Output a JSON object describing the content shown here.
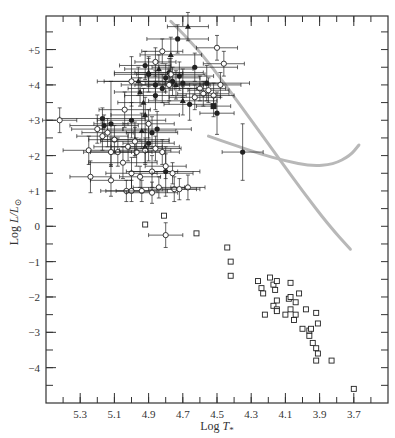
{
  "chart_data": {
    "type": "scatter",
    "title": "",
    "xlabel": "Log T*",
    "xlabel_parts": {
      "main": "Log ",
      "var": "T",
      "sub": "*"
    },
    "ylabel": "Log L/L⊙",
    "ylabel_parts": {
      "main": "Log ",
      "var": "L/L",
      "sub": "⊙"
    },
    "xlim": [
      5.5,
      3.5
    ],
    "ylim": [
      -5.0,
      5.95
    ],
    "x_reversed": true,
    "grid": false,
    "legend": null,
    "xticks": [
      5.3,
      5.1,
      4.9,
      4.7,
      4.5,
      4.3,
      4.1,
      3.9,
      3.7
    ],
    "xtick_labels": [
      "5.3",
      "5.1",
      "4.9",
      "4.7",
      "4.5",
      "4.3",
      "4.1",
      "3.9",
      "3.7"
    ],
    "xminor_step": 0.1,
    "yticks": [
      5,
      4,
      3,
      2,
      1,
      0,
      -1,
      -2,
      -3,
      -4
    ],
    "ytick_labels": [
      "+5",
      "+4",
      "+3",
      "+2",
      "+1",
      "0",
      "−1",
      "−2",
      "−3",
      "−4"
    ],
    "yminor_step": 0.5,
    "colors": {
      "axis": "#333333",
      "points": "#222222",
      "curves": "#b8b8b8"
    },
    "series": [
      {
        "name": "filled-circles",
        "marker": "filled-circle",
        "points": [
          {
            "x": 4.35,
            "y": 2.1,
            "xerr": 0.12,
            "yerr": 0.8
          },
          {
            "x": 4.73,
            "y": 5.3,
            "xerr": 0.18,
            "yerr": 0.4
          },
          {
            "x": 4.56,
            "y": 4.05,
            "xerr": 0.25,
            "yerr": 0.5
          },
          {
            "x": 4.66,
            "y": 3.45,
            "xerr": 0.15,
            "yerr": 0.45
          },
          {
            "x": 4.5,
            "y": 3.2,
            "xerr": 0.1,
            "yerr": 0.6
          },
          {
            "x": 5.12,
            "y": 2.9,
            "xerr": 0.1,
            "yerr": 1.2
          },
          {
            "x": 5.17,
            "y": 3.05,
            "xerr": 0.25,
            "yerr": 0.3
          },
          {
            "x": 5.16,
            "y": 2.85,
            "xerr": 0.2,
            "yerr": 0.3
          },
          {
            "x": 5.0,
            "y": 3.0,
            "xerr": 0.2,
            "yerr": 0.5
          },
          {
            "x": 4.92,
            "y": 4.55,
            "xerr": 0.15,
            "yerr": 0.4
          },
          {
            "x": 4.9,
            "y": 4.3,
            "xerr": 0.2,
            "yerr": 0.5
          },
          {
            "x": 4.86,
            "y": 4.0,
            "xerr": 0.2,
            "yerr": 0.4
          },
          {
            "x": 4.86,
            "y": 3.7,
            "xerr": 0.18,
            "yerr": 0.4
          },
          {
            "x": 4.82,
            "y": 3.9,
            "xerr": 0.2,
            "yerr": 0.4
          },
          {
            "x": 4.8,
            "y": 4.2,
            "xerr": 0.2,
            "yerr": 0.4
          },
          {
            "x": 4.78,
            "y": 4.35,
            "xerr": 0.2,
            "yerr": 0.4
          },
          {
            "x": 4.76,
            "y": 4.1,
            "xerr": 0.2,
            "yerr": 0.4
          },
          {
            "x": 4.72,
            "y": 4.25,
            "xerr": 0.2,
            "yerr": 0.4
          },
          {
            "x": 4.7,
            "y": 4.05,
            "xerr": 0.22,
            "yerr": 0.4
          },
          {
            "x": 4.63,
            "y": 4.5,
            "xerr": 0.25,
            "yerr": 0.4
          },
          {
            "x": 4.9,
            "y": 2.35,
            "xerr": 0.15,
            "yerr": 0.5
          },
          {
            "x": 4.88,
            "y": 2.65,
            "xerr": 0.15,
            "yerr": 0.45
          },
          {
            "x": 4.8,
            "y": 1.55,
            "xerr": 0.2,
            "yerr": 0.7
          },
          {
            "x": 4.85,
            "y": 2.75,
            "xerr": 0.2,
            "yerr": 0.5
          }
        ]
      },
      {
        "name": "filled-triangles",
        "marker": "filled-triangle",
        "points": [
          {
            "x": 4.67,
            "y": 5.65,
            "xerr": 0.12,
            "yerr": 0.4
          },
          {
            "x": 4.77,
            "y": 4.85,
            "xerr": 0.18,
            "yerr": 0.5
          },
          {
            "x": 4.96,
            "y": 4.1,
            "xerr": 0.2,
            "yerr": 0.4
          },
          {
            "x": 4.9,
            "y": 4.35,
            "xerr": 0.2,
            "yerr": 0.4
          },
          {
            "x": 4.84,
            "y": 4.45,
            "xerr": 0.2,
            "yerr": 0.4
          },
          {
            "x": 4.74,
            "y": 4.0,
            "xerr": 0.2,
            "yerr": 0.4
          },
          {
            "x": 4.7,
            "y": 3.55,
            "xerr": 0.2,
            "yerr": 0.4
          },
          {
            "x": 4.95,
            "y": 3.8,
            "xerr": 0.15,
            "yerr": 0.4
          },
          {
            "x": 4.93,
            "y": 3.5,
            "xerr": 0.15,
            "yerr": 0.4
          },
          {
            "x": 4.92,
            "y": 3.15,
            "xerr": 0.2,
            "yerr": 0.5
          },
          {
            "x": 4.94,
            "y": 2.7,
            "xerr": 0.2,
            "yerr": 0.5
          },
          {
            "x": 4.98,
            "y": 2.45,
            "xerr": 0.2,
            "yerr": 0.5
          },
          {
            "x": 4.92,
            "y": 2.25,
            "xerr": 0.2,
            "yerr": 0.5
          }
        ]
      },
      {
        "name": "filled-square",
        "marker": "filled-square",
        "points": [
          {
            "x": 4.52,
            "y": 3.4,
            "xerr": 0.1,
            "yerr": 0.3
          }
        ]
      },
      {
        "name": "open-circles",
        "marker": "open-circle",
        "points": [
          {
            "x": 5.42,
            "y": 3.0,
            "xerr": 0.1,
            "yerr": 0.35
          },
          {
            "x": 5.0,
            "y": 4.1,
            "xerr": 0.2,
            "yerr": 0.7
          },
          {
            "x": 5.04,
            "y": 3.3,
            "xerr": 0.15,
            "yerr": 0.5
          },
          {
            "x": 4.86,
            "y": 4.65,
            "xerr": 0.12,
            "yerr": 0.4
          },
          {
            "x": 4.82,
            "y": 4.95,
            "xerr": 0.12,
            "yerr": 0.35
          },
          {
            "x": 4.77,
            "y": 4.3,
            "xerr": 0.2,
            "yerr": 0.45
          },
          {
            "x": 4.78,
            "y": 4.0,
            "xerr": 0.2,
            "yerr": 0.45
          },
          {
            "x": 4.5,
            "y": 5.05,
            "xerr": 0.12,
            "yerr": 0.35
          },
          {
            "x": 4.46,
            "y": 4.6,
            "xerr": 0.12,
            "yerr": 0.35
          },
          {
            "x": 4.6,
            "y": 3.9,
            "xerr": 0.15,
            "yerr": 0.35
          },
          {
            "x": 4.58,
            "y": 3.75,
            "xerr": 0.15,
            "yerr": 0.35
          },
          {
            "x": 4.55,
            "y": 3.85,
            "xerr": 0.12,
            "yerr": 0.35
          },
          {
            "x": 4.52,
            "y": 3.7,
            "xerr": 0.12,
            "yerr": 0.35
          },
          {
            "x": 4.63,
            "y": 3.65,
            "xerr": 0.15,
            "yerr": 0.35
          },
          {
            "x": 4.48,
            "y": 4.0,
            "xerr": 0.12,
            "yerr": 0.35
          },
          {
            "x": 5.2,
            "y": 2.75,
            "xerr": 0.15,
            "yerr": 0.4
          },
          {
            "x": 5.17,
            "y": 2.55,
            "xerr": 0.15,
            "yerr": 0.4
          },
          {
            "x": 5.14,
            "y": 2.65,
            "xerr": 0.15,
            "yerr": 0.4
          },
          {
            "x": 5.1,
            "y": 2.45,
            "xerr": 0.15,
            "yerr": 0.4
          },
          {
            "x": 5.08,
            "y": 2.1,
            "xerr": 0.2,
            "yerr": 0.4
          },
          {
            "x": 5.02,
            "y": 2.25,
            "xerr": 0.2,
            "yerr": 0.4
          },
          {
            "x": 4.97,
            "y": 2.1,
            "xerr": 0.15,
            "yerr": 0.4
          },
          {
            "x": 4.9,
            "y": 2.9,
            "xerr": 0.15,
            "yerr": 0.4
          },
          {
            "x": 4.98,
            "y": 2.4,
            "xerr": 0.2,
            "yerr": 0.4
          },
          {
            "x": 5.25,
            "y": 2.15,
            "xerr": 0.15,
            "yerr": 0.4
          },
          {
            "x": 5.12,
            "y": 2.1,
            "xerr": 0.12,
            "yerr": 0.4
          },
          {
            "x": 5.05,
            "y": 1.8,
            "xerr": 0.2,
            "yerr": 0.45
          },
          {
            "x": 5.0,
            "y": 1.5,
            "xerr": 0.15,
            "yerr": 0.45
          },
          {
            "x": 4.88,
            "y": 1.55,
            "xerr": 0.15,
            "yerr": 0.45
          },
          {
            "x": 5.24,
            "y": 1.4,
            "xerr": 0.12,
            "yerr": 0.45
          },
          {
            "x": 5.12,
            "y": 1.3,
            "xerr": 0.12,
            "yerr": 0.45
          },
          {
            "x": 5.03,
            "y": 1.0,
            "xerr": 0.15,
            "yerr": 0.3
          },
          {
            "x": 5.0,
            "y": 1.0,
            "xerr": 0.15,
            "yerr": 0.3
          },
          {
            "x": 4.94,
            "y": 1.0,
            "xerr": 0.15,
            "yerr": 0.3
          },
          {
            "x": 4.88,
            "y": 0.95,
            "xerr": 0.15,
            "yerr": 0.3
          },
          {
            "x": 4.84,
            "y": 1.1,
            "xerr": 0.15,
            "yerr": 0.3
          },
          {
            "x": 4.75,
            "y": 1.05,
            "xerr": 0.15,
            "yerr": 0.35
          },
          {
            "x": 4.95,
            "y": 1.4,
            "xerr": 0.12,
            "yerr": 0.3
          },
          {
            "x": 4.92,
            "y": 2.15,
            "xerr": 0.15,
            "yerr": 0.35
          },
          {
            "x": 4.86,
            "y": 2.2,
            "xerr": 0.15,
            "yerr": 0.35
          },
          {
            "x": 4.82,
            "y": 2.1,
            "xerr": 0.1,
            "yerr": 0.35
          },
          {
            "x": 4.8,
            "y": 1.7,
            "xerr": 0.12,
            "yerr": 0.35
          },
          {
            "x": 4.76,
            "y": 1.5,
            "xerr": 0.12,
            "yerr": 0.3
          },
          {
            "x": 4.67,
            "y": 1.1,
            "xerr": 0.1,
            "yerr": 0.35
          },
          {
            "x": 4.72,
            "y": 1.05,
            "xerr": 0.1,
            "yerr": 0.3
          },
          {
            "x": 4.8,
            "y": -0.25,
            "xerr": 0.1,
            "yerr": 0.35
          }
        ]
      },
      {
        "name": "open-squares",
        "marker": "open-square",
        "points": [
          {
            "x": 4.92,
            "y": 0.05
          },
          {
            "x": 4.81,
            "y": 0.3
          },
          {
            "x": 4.62,
            "y": -0.2
          },
          {
            "x": 4.44,
            "y": -0.6
          },
          {
            "x": 4.42,
            "y": -1.0
          },
          {
            "x": 4.42,
            "y": -1.4
          },
          {
            "x": 4.26,
            "y": -1.55
          },
          {
            "x": 4.24,
            "y": -1.75
          },
          {
            "x": 4.23,
            "y": -1.9
          },
          {
            "x": 4.19,
            "y": -1.45
          },
          {
            "x": 4.17,
            "y": -1.65
          },
          {
            "x": 4.15,
            "y": -1.55
          },
          {
            "x": 4.16,
            "y": -1.8
          },
          {
            "x": 4.07,
            "y": -1.6
          },
          {
            "x": 4.15,
            "y": -2.1
          },
          {
            "x": 4.17,
            "y": -2.25
          },
          {
            "x": 4.15,
            "y": -2.35
          },
          {
            "x": 4.15,
            "y": -2.4
          },
          {
            "x": 4.22,
            "y": -2.5
          },
          {
            "x": 4.08,
            "y": -2.05
          },
          {
            "x": 4.07,
            "y": -2.0
          },
          {
            "x": 4.02,
            "y": -1.9
          },
          {
            "x": 4.04,
            "y": -2.15
          },
          {
            "x": 4.07,
            "y": -2.35
          },
          {
            "x": 3.98,
            "y": -2.35
          },
          {
            "x": 3.92,
            "y": -2.45
          },
          {
            "x": 4.1,
            "y": -2.5
          },
          {
            "x": 4.04,
            "y": -2.5
          },
          {
            "x": 4.05,
            "y": -2.65
          },
          {
            "x": 4.0,
            "y": -2.9
          },
          {
            "x": 3.96,
            "y": -2.95
          },
          {
            "x": 3.95,
            "y": -2.9
          },
          {
            "x": 3.91,
            "y": -2.75
          },
          {
            "x": 3.96,
            "y": -3.1
          },
          {
            "x": 3.94,
            "y": -3.3
          },
          {
            "x": 3.92,
            "y": -3.45
          },
          {
            "x": 3.91,
            "y": -3.6
          },
          {
            "x": 3.92,
            "y": -3.8
          },
          {
            "x": 3.83,
            "y": -3.8
          },
          {
            "x": 3.7,
            "y": -4.6
          }
        ]
      }
    ],
    "curves": [
      {
        "name": "diagonal-track",
        "color": "#b8b8b8",
        "points": [
          [
            4.77,
            5.8
          ],
          [
            4.6,
            4.95
          ],
          [
            4.45,
            4.0
          ],
          [
            4.3,
            3.0
          ],
          [
            4.15,
            2.0
          ],
          [
            4.0,
            1.0
          ],
          [
            3.85,
            0.05
          ],
          [
            3.72,
            -0.65
          ]
        ]
      },
      {
        "name": "curved-track",
        "color": "#b8b8b8",
        "points": [
          [
            4.55,
            2.55
          ],
          [
            4.4,
            2.3
          ],
          [
            4.25,
            2.05
          ],
          [
            4.1,
            1.85
          ],
          [
            3.95,
            1.7
          ],
          [
            3.82,
            1.75
          ],
          [
            3.72,
            2.0
          ],
          [
            3.67,
            2.3
          ]
        ]
      }
    ]
  }
}
